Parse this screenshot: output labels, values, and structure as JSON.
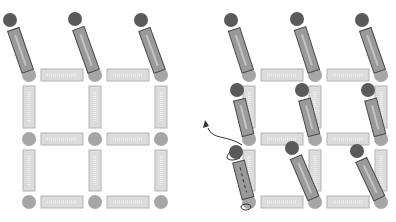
{
  "figure": {
    "colors": {
      "background": "#ffffff",
      "node": "#a6a6a6",
      "bar_fill": "#dcdcdc",
      "bar_stroke": "#b4b4b4",
      "rod_fill": "#9a9a9a",
      "rod_stroke": "#4a4a4a",
      "rod_highlight": "#c4c4c4",
      "ball": "#5a5a5a",
      "arrow": "#333333"
    },
    "panels": [
      {
        "name": "left-lattice",
        "nodes_x": [
          29,
          95,
          161
        ],
        "nodes_y": [
          75,
          139,
          202
        ],
        "tilted_rods": [
          {
            "ball": [
              10,
              20
            ],
            "end": [
              29,
              75
            ]
          },
          {
            "ball": [
              75,
              19
            ],
            "end": [
              95,
              75
            ]
          },
          {
            "ball": [
              141,
              20
            ],
            "end": [
              161,
              75
            ]
          }
        ]
      },
      {
        "name": "right-lattice",
        "nodes_x": [
          249,
          315,
          381
        ],
        "nodes_y": [
          75,
          139,
          202
        ],
        "tilted_rods": [
          {
            "ball": [
              231,
              20
            ],
            "end": [
              249,
              75
            ]
          },
          {
            "ball": [
              297,
              19
            ],
            "end": [
              315,
              75
            ]
          },
          {
            "ball": [
              362,
              20
            ],
            "end": [
              381,
              75
            ]
          },
          {
            "ball": [
              237,
              90
            ],
            "end": [
              249,
              139
            ],
            "hidden": true
          },
          {
            "ball": [
              302,
              90
            ],
            "end": [
              315,
              139
            ]
          },
          {
            "ball": [
              368,
              90
            ],
            "end": [
              381,
              139
            ]
          },
          {
            "ball": [
              236,
              152
            ],
            "end": [
              249,
              202
            ],
            "dashed": true
          },
          {
            "ball": [
              292,
              148
            ],
            "end": [
              315,
              202
            ]
          },
          {
            "ball": [
              357,
              151
            ],
            "end": [
              381,
              202
            ]
          }
        ],
        "rotation_arrow": {
          "from": [
            236,
            152
          ],
          "to": [
            205,
            122
          ]
        }
      }
    ]
  }
}
